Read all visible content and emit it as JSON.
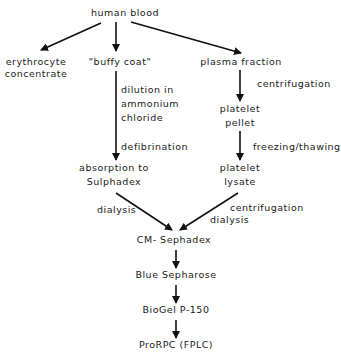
{
  "nodes": {
    "human_blood": "human blood",
    "erythrocyte_1": "erythrocyte",
    "erythrocyte_2": "concentrate",
    "buffy_coat": "\"buffy coat\"",
    "plasma_fraction": "plasma fraction",
    "platelet_pellet_1": "platelet",
    "platelet_pellet_2": "pellet",
    "platelet_lysate_1": "platelet",
    "platelet_lysate_2": "lysate",
    "absorption_1": "absorption to",
    "absorption_2": "Sulphadex",
    "cm_sephadex": "CM- Sephadex",
    "blue_sepharose": "Blue Sepharose",
    "biogel": "BioGel P-150",
    "prorpc": "ProRPC (FPLC)"
  },
  "edge_labels": {
    "dilution_1": "dilution in",
    "dilution_2": "ammonium",
    "dilution_3": "chloride",
    "defibrination": "defibrination",
    "centrifugation_plasma": "centrifugation",
    "freezing": "freezing/thawing",
    "dialysis_left": "dialysis",
    "centrifugation_right": "centrifugation",
    "dialysis_right": "dialysis"
  }
}
